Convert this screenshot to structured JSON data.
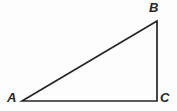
{
  "figure": {
    "name": "right-triangle-ABC",
    "background_color": "#fdfdfd",
    "stroke_color": "#262626",
    "stroke_width": 1.7,
    "width": 177,
    "height": 111,
    "vertices": [
      {
        "id": "A",
        "label": "A",
        "x": 22,
        "y": 101,
        "label_x": 7,
        "label_y": 91
      },
      {
        "id": "B",
        "label": "B",
        "x": 157,
        "y": 21,
        "label_x": 149,
        "label_y": 1
      },
      {
        "id": "C",
        "label": "C",
        "x": 157,
        "y": 101,
        "label_x": 160,
        "label_y": 91
      }
    ],
    "edges": [
      {
        "id": "AB",
        "from": "A",
        "to": "B",
        "role": "hypotenuse"
      },
      {
        "id": "BC",
        "from": "B",
        "to": "C",
        "role": "vertical-leg"
      },
      {
        "id": "CA",
        "from": "C",
        "to": "A",
        "role": "horizontal-leg"
      }
    ],
    "right_angle_at": "C",
    "polygon_points": "22,101 157,21 157,101"
  }
}
